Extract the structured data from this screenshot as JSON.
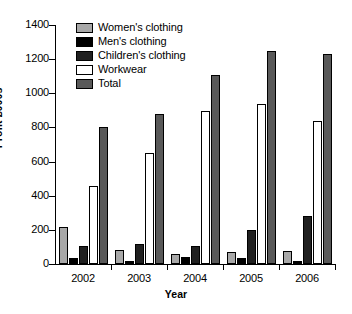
{
  "chart_data": {
    "type": "bar",
    "title": "",
    "xlabel": "Year",
    "ylabel": "Profit £000s",
    "categories": [
      "2002",
      "2003",
      "2004",
      "2005",
      "2006"
    ],
    "ylim": [
      0,
      1400
    ],
    "yticks": [
      0,
      200,
      400,
      600,
      800,
      1000,
      1200,
      1400
    ],
    "ytick_labels": [
      "0",
      "200",
      "400",
      "600",
      "800",
      "1000",
      "1200",
      "1400"
    ],
    "grid": false,
    "legend_position": "upper-left-inside",
    "series": [
      {
        "name": "Women's clothing",
        "color": "#a8a8a8",
        "values": [
          215,
          85,
          60,
          70,
          75
        ]
      },
      {
        "name": "Men's clothing",
        "color": "#000000",
        "values": [
          35,
          20,
          40,
          35,
          20
        ]
      },
      {
        "name": "Children's clothing",
        "color": "#202020",
        "values": [
          105,
          120,
          105,
          200,
          280
        ]
      },
      {
        "name": "Workwear",
        "color": "#ffffff",
        "values": [
          455,
          650,
          895,
          940,
          840
        ]
      },
      {
        "name": "Total",
        "color": "#595959",
        "values": [
          800,
          880,
          1110,
          1250,
          1230
        ]
      }
    ]
  }
}
